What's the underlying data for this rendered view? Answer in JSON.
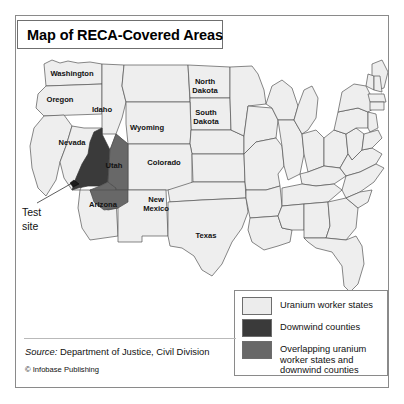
{
  "figure": {
    "title": "Map of RECA-Covered Areas"
  },
  "map": {
    "callout": {
      "line1": "Test",
      "line2": "site"
    },
    "state_labels": [
      {
        "name": "Washington",
        "x": 56,
        "y": 26
      },
      {
        "name": "Oregon",
        "x": 44,
        "y": 52
      },
      {
        "name": "Idaho",
        "x": 86,
        "y": 62
      },
      {
        "name": "Wyoming",
        "x": 131,
        "y": 80
      },
      {
        "name": "North Dakota",
        "x": 189,
        "y": 38
      },
      {
        "name": "South Dakota",
        "x": 190,
        "y": 69
      },
      {
        "name": "Nevada",
        "x": 56,
        "y": 95
      },
      {
        "name": "Utah",
        "x": 98,
        "y": 118
      },
      {
        "name": "Colorado",
        "x": 148,
        "y": 115
      },
      {
        "name": "Arizona",
        "x": 87,
        "y": 157
      },
      {
        "name": "New Mexico",
        "x": 140,
        "y": 156
      },
      {
        "name": "Texas",
        "x": 190,
        "y": 188
      }
    ]
  },
  "legend": {
    "items": [
      {
        "label": "Uranium worker states",
        "color": "#ececec"
      },
      {
        "label": "Downwind counties",
        "color": "#3a3a3a"
      },
      {
        "label": "Overlapping uranium worker states and downwind counties",
        "color": "#686868"
      }
    ]
  },
  "footer": {
    "source_label": "Source:",
    "source_value": " Department of Justice, Civil Division",
    "copyright": "© Infobase Publishing"
  },
  "colors": {
    "state_fill": "#eeeeee",
    "state_stroke": "#555555",
    "downwind": "#3a3a3a",
    "overlapping": "#686868",
    "frame": "#8a8a8a"
  }
}
